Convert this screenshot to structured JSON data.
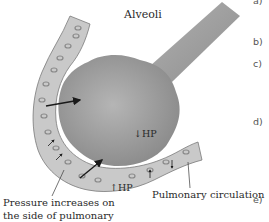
{
  "diagram": {
    "title": "Alveoli",
    "labels": {
      "hp_alveolus": "↓HP",
      "hp_vessel": "↑HP",
      "pulmonary_circulation": "Pulmonary circulation",
      "pressure_line1": "Pressure increases on",
      "pressure_line2": "the side of pulmonary"
    },
    "option_markers": [
      "a)",
      "b)",
      "c)",
      "d)",
      "e)"
    ],
    "colors": {
      "alveolus_fill": "#9a9a9a",
      "vessel_fill": "#c9c9c9",
      "vessel_outline": "#7a7a7a",
      "arrow": "#1a1a1a",
      "text": "#2a2a2a"
    }
  }
}
